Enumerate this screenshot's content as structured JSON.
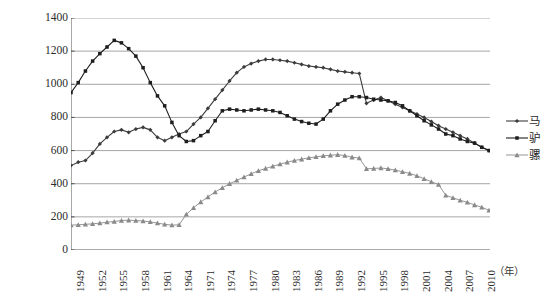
{
  "chart_data": {
    "type": "line",
    "title": "",
    "xlabel": "（年）",
    "ylabel": "单位：万匹（头）",
    "ylim": [
      0,
      1400
    ],
    "yticks": [
      1400,
      1200,
      1000,
      800,
      600,
      400,
      200,
      0
    ],
    "grid": true,
    "legend_position": "right",
    "x": [
      "1949",
      "1950",
      "1951",
      "1952",
      "1953",
      "1954",
      "1955",
      "1956",
      "1957",
      "1958",
      "1959",
      "1960",
      "1961",
      "1962",
      "1963",
      "1964",
      "1971",
      "1972",
      "1973",
      "1974",
      "1975",
      "1976",
      "1977",
      "1978",
      "1979",
      "1980",
      "1981",
      "1982",
      "1983",
      "1984",
      "1985",
      "1986",
      "1987",
      "1988",
      "1989",
      "1990",
      "1991",
      "1992",
      "1993",
      "1994",
      "1995",
      "1996",
      "1997",
      "1998",
      "1999",
      "2000",
      "2001",
      "2002",
      "2003",
      "2004",
      "2005",
      "2006",
      "2007",
      "2008",
      "2009",
      "2010",
      "2011",
      "2012",
      "2013"
    ],
    "xtick_labels": [
      "1949",
      "1952",
      "1955",
      "1958",
      "1961",
      "1964",
      "1971",
      "1974",
      "1977",
      "1980",
      "1983",
      "1986",
      "1989",
      "1992",
      "1995",
      "1998",
      "2001",
      "2004",
      "2007",
      "2010",
      "2013"
    ],
    "xtick_step": 3,
    "series": [
      {
        "name": "马",
        "marker": "diamond",
        "color": "#3c3c3c",
        "values": [
          510,
          530,
          540,
          585,
          640,
          680,
          715,
          725,
          710,
          730,
          740,
          725,
          680,
          660,
          680,
          700,
          715,
          760,
          800,
          855,
          910,
          965,
          1020,
          1070,
          1105,
          1125,
          1140,
          1150,
          1150,
          1145,
          1140,
          1130,
          1120,
          1110,
          1105,
          1100,
          1090,
          1080,
          1075,
          1070,
          1065,
          885,
          905,
          920,
          900,
          880,
          860,
          840,
          820,
          800,
          775,
          750,
          730,
          710,
          690,
          670,
          645,
          620,
          600
        ]
      },
      {
        "name": "驴",
        "marker": "square",
        "color": "#1e1e1e",
        "values": [
          950,
          1010,
          1080,
          1140,
          1185,
          1225,
          1265,
          1250,
          1215,
          1170,
          1100,
          1010,
          930,
          870,
          770,
          690,
          655,
          660,
          690,
          715,
          780,
          840,
          850,
          845,
          840,
          845,
          850,
          845,
          840,
          830,
          810,
          790,
          775,
          765,
          760,
          790,
          840,
          880,
          905,
          925,
          925,
          920,
          910,
          905,
          900,
          890,
          870,
          840,
          810,
          780,
          755,
          730,
          700,
          690,
          670,
          655,
          645,
          620,
          600
        ]
      },
      {
        "name": "骡",
        "marker": "triangle",
        "color": "#8a8a8a",
        "values": [
          150,
          152,
          155,
          158,
          162,
          168,
          172,
          178,
          180,
          178,
          175,
          170,
          162,
          155,
          150,
          152,
          215,
          255,
          290,
          320,
          350,
          375,
          400,
          420,
          440,
          460,
          478,
          492,
          505,
          518,
          530,
          540,
          548,
          556,
          562,
          568,
          572,
          575,
          570,
          560,
          555,
          490,
          492,
          495,
          490,
          482,
          472,
          462,
          448,
          430,
          412,
          395,
          330,
          315,
          300,
          288,
          272,
          258,
          240
        ]
      }
    ]
  },
  "axes": {
    "y_title": "单位：万匹（头）",
    "x_unit": "（年）"
  },
  "legend": {
    "items": [
      {
        "label": "马",
        "marker": "diamond",
        "color": "#3c3c3c"
      },
      {
        "label": "驴",
        "marker": "square",
        "color": "#1e1e1e"
      },
      {
        "label": "骡",
        "marker": "triangle",
        "color": "#8a8a8a"
      }
    ]
  },
  "colors": {
    "grid": "#8f8f8f",
    "axis": "#555555",
    "series_horse": "#3c3c3c",
    "series_donkey": "#1e1e1e",
    "series_mule": "#8a8a8a",
    "background": "#ffffff"
  }
}
